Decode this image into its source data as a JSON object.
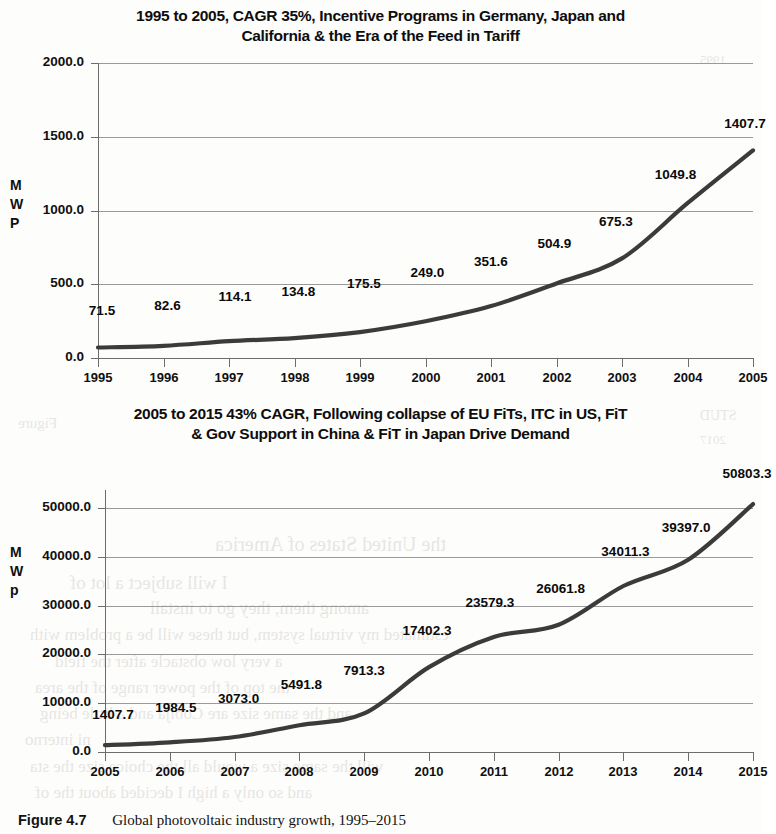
{
  "figure": {
    "caption_number": "Figure 4.7",
    "caption_text": "Global photovoltaic industry growth, 1995–2015"
  },
  "ghost_text": [
    {
      "t": "1995",
      "x": 700,
      "y": 52,
      "s": 13
    },
    {
      "t": "Figure",
      "x": 18,
      "y": 415,
      "s": 15
    },
    {
      "t": "the United States of America",
      "x": 215,
      "y": 533,
      "s": 20
    },
    {
      "t": "I will subject a lot of",
      "x": 70,
      "y": 572,
      "s": 19
    },
    {
      "t": "among them, they go to install",
      "x": 150,
      "y": 598,
      "s": 18
    },
    {
      "t": "estimated my virtual system, but these will be a problem with",
      "x": 30,
      "y": 625,
      "s": 17
    },
    {
      "t": "a very low obstacle after the field",
      "x": 55,
      "y": 652,
      "s": 17
    },
    {
      "t": "the top of the power range of the area",
      "x": 35,
      "y": 678,
      "s": 17
    },
    {
      "t": "and the same size are Cobija and a little being",
      "x": 40,
      "y": 704,
      "s": 17
    },
    {
      "t": "ni interno",
      "x": 25,
      "y": 730,
      "s": 17
    },
    {
      "t": "will the same size a would all the choice size the sta",
      "x": 30,
      "y": 757,
      "s": 17
    },
    {
      "t": "and so only a high I decided about the of",
      "x": 35,
      "y": 783,
      "s": 17
    },
    {
      "t": "2017",
      "x": 700,
      "y": 432,
      "s": 13
    },
    {
      "t": "STUD",
      "x": 700,
      "y": 408,
      "s": 14
    }
  ],
  "charts": [
    {
      "id": "chart-top",
      "title_line1": "1995 to 2005, CAGR 35%, Incentive Programs in Germany, Japan and",
      "title_line2": "California & the Era of the Feed in Tariff",
      "chart_data": {
        "type": "line",
        "title": "1995 to 2005, CAGR 35%, Incentive Programs in Germany, Japan and California & the Era of the Feed in Tariff",
        "xlabel": "",
        "ylabel": "MWP",
        "categories": [
          "1995",
          "1996",
          "1997",
          "1998",
          "1999",
          "2000",
          "2001",
          "2002",
          "2003",
          "2004",
          "2005"
        ],
        "values": [
          71.5,
          82.6,
          114.1,
          134.8,
          175.5,
          249.0,
          351.6,
          504.9,
          675.3,
          1049.8,
          1407.7
        ],
        "data_labels": [
          "71.5",
          "82.6",
          "114.1",
          "134.8",
          "175.5",
          "249.0",
          "351.6",
          "504.9",
          "675.3",
          "1049.8",
          "1407.7"
        ],
        "ylim": [
          0,
          2000
        ],
        "yticks": [
          0,
          500,
          1000,
          1500,
          2000
        ],
        "ytick_labels": [
          "0.0",
          "500.0",
          "1000.0",
          "1500.0",
          "2000.0"
        ],
        "grid": true,
        "legend": "none",
        "series_color": "#3b3b3b"
      },
      "axis_title_chars": [
        "M",
        "W",
        "P"
      ]
    },
    {
      "id": "chart-bottom",
      "title_line1": "2005 to 2015 43% CAGR, Following collapse of EU FiTs, ITC in US, FiT",
      "title_line2": "& Gov Support in China & FiT in Japan  Drive Demand",
      "chart_data": {
        "type": "line",
        "title": "2005 to 2015 43% CAGR, Following collapse of EU FiTs, ITC in US, FiT & Gov Support in China & FiT in Japan Drive Demand",
        "xlabel": "",
        "ylabel": "MWp",
        "categories": [
          "2005",
          "2006",
          "2007",
          "2008",
          "2009",
          "2010",
          "2011",
          "2012",
          "2013",
          "2014",
          "2015"
        ],
        "values": [
          1407.7,
          1984.5,
          3073.0,
          5491.8,
          7913.3,
          17402.3,
          23579.3,
          26061.8,
          34011.3,
          39397.0,
          50803.3
        ],
        "data_labels": [
          "1407.7",
          "1984.5",
          "3073.0",
          "5491.8",
          "7913.3",
          "17402.3",
          "23579.3",
          "26061.8",
          "34011.3",
          "39397.0",
          "50803.3"
        ],
        "ylim": [
          0,
          50000
        ],
        "yticks": [
          0,
          10000,
          20000,
          30000,
          40000,
          50000
        ],
        "ytick_labels": [
          "0.0",
          "10000.0",
          "20000.0",
          "30000.0",
          "40000.0",
          "50000.0"
        ],
        "grid": true,
        "legend": "none",
        "series_color": "#3b3b3b"
      },
      "axis_title_chars": [
        "M",
        "W",
        "p"
      ]
    }
  ]
}
